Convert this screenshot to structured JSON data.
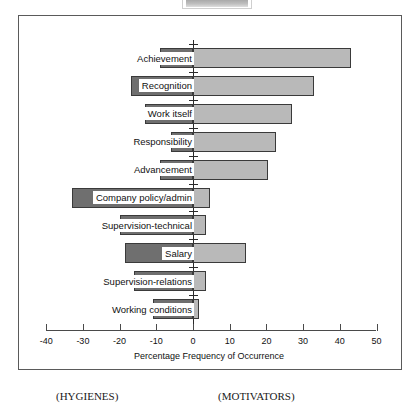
{
  "chart_data": {
    "type": "bar",
    "orientation": "horizontal",
    "title": "",
    "xlabel": "Percentage Frequency of Occurrence",
    "ylabel": "",
    "xlim": [
      -40,
      50
    ],
    "xticks": [
      -40,
      -30,
      -20,
      -10,
      0,
      10,
      20,
      30,
      40,
      50
    ],
    "xtick_labels": [
      "-40",
      "-30",
      "-20",
      "-10",
      "0",
      "10",
      "20",
      "30",
      "40",
      "50"
    ],
    "grid": false,
    "legend_position": "none",
    "categories": [
      "Achievement",
      "Recognition",
      "Work itself",
      "Responsibility",
      "Advancement",
      "Company policy/admin",
      "Supervision-technical",
      "Salary",
      "Supervision-relations",
      "Working conditions"
    ],
    "series": [
      {
        "name": "Hygienes",
        "color": "#6f6f6f",
        "values": [
          -9,
          -17,
          -13,
          -6,
          -9,
          -33,
          -20,
          -18.5,
          -16,
          -11
        ]
      },
      {
        "name": "Motivators",
        "color": "#b9b9b9",
        "values": [
          43,
          33,
          27,
          22.5,
          20.5,
          4.5,
          3.5,
          14.5,
          3.5,
          1.5
        ]
      }
    ],
    "annotations": [
      {
        "text": "(HYGIENES)",
        "position": "below-left"
      },
      {
        "text": "(MOTIVATORS)",
        "position": "below-center"
      }
    ]
  },
  "axis": {
    "title": "Percentage Frequency of Occurrence",
    "ticks": [
      "-40",
      "-30",
      "-20",
      "-10",
      "0",
      "10",
      "20",
      "30",
      "40",
      "50"
    ]
  },
  "captions": {
    "left": "(HYGIENES)",
    "right": "(MOTIVATORS)"
  },
  "colors": {
    "hygiene_bar": "#6f6f6f",
    "motivator_bar": "#b9b9b9",
    "frame": "#5a5a5a",
    "axis": "#4a4a4a",
    "text": "#111111"
  }
}
